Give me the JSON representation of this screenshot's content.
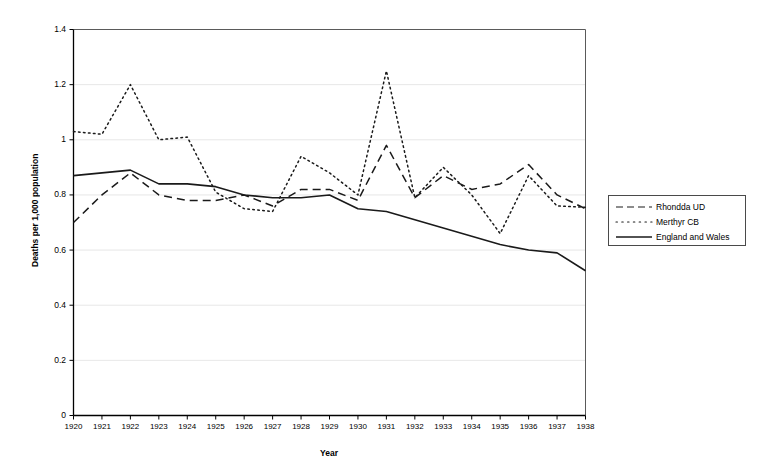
{
  "chart_data": {
    "type": "line",
    "title": "",
    "xlabel": "Year",
    "ylabel": "Deaths per 1,000 population",
    "x": [
      1920,
      1921,
      1922,
      1923,
      1924,
      1925,
      1926,
      1927,
      1928,
      1929,
      1930,
      1931,
      1932,
      1933,
      1934,
      1935,
      1936,
      1937,
      1938
    ],
    "xtick_labels": [
      "1920",
      "1921",
      "1922",
      "1923",
      "1924",
      "1925",
      "1926",
      "1927",
      "1928",
      "1929",
      "1930",
      "1931",
      "1932",
      "1933",
      "1934",
      "1935",
      "1936",
      "1937",
      "1938"
    ],
    "ytick_labels": [
      "0",
      "0.2",
      "0.4",
      "0.6",
      "0.8",
      "1",
      "1.2",
      "1.4"
    ],
    "ytick_values": [
      0,
      0.2,
      0.4,
      0.6,
      0.8,
      1.0,
      1.2,
      1.4
    ],
    "ylim": [
      0,
      1.4
    ],
    "xlim": [
      1920,
      1938
    ],
    "grid": "horizontal",
    "legend_position": "right-outside",
    "series": [
      {
        "name": "Rhondda UD",
        "style": "dashed",
        "color": "#1a1a1a",
        "values": [
          0.7,
          0.8,
          0.88,
          0.8,
          0.78,
          0.78,
          0.8,
          0.76,
          0.82,
          0.82,
          0.78,
          0.98,
          0.79,
          0.87,
          0.82,
          0.84,
          0.91,
          0.8,
          0.75
        ]
      },
      {
        "name": "Merthyr CB",
        "style": "dotted",
        "color": "#1a1a1a",
        "values": [
          1.03,
          1.02,
          1.2,
          1.0,
          1.01,
          0.81,
          0.75,
          0.74,
          0.94,
          0.88,
          0.8,
          1.25,
          0.79,
          0.9,
          0.8,
          0.66,
          0.87,
          0.76,
          0.755
        ]
      },
      {
        "name": "England and Wales",
        "style": "solid",
        "color": "#1a1a1a",
        "values": [
          0.87,
          0.88,
          0.89,
          0.84,
          0.84,
          0.83,
          0.8,
          0.79,
          0.79,
          0.8,
          0.75,
          0.74,
          0.71,
          0.68,
          0.65,
          0.62,
          0.6,
          0.59,
          0.525
        ]
      }
    ]
  },
  "legend": {
    "entries": [
      {
        "label": "Rhondda UD"
      },
      {
        "label": "Merthyr CB"
      },
      {
        "label": "England and Wales"
      }
    ]
  }
}
